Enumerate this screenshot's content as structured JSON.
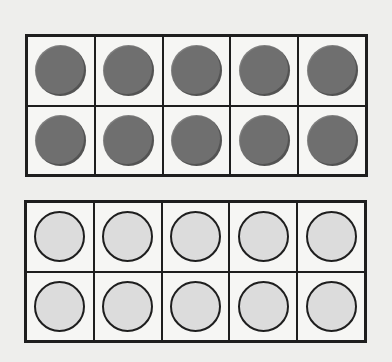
{
  "diagram": {
    "type": "ten-frames",
    "frames": [
      {
        "id": "top",
        "rows": 2,
        "columns": 5,
        "filled_count": 10,
        "cells": [
          "filled",
          "filled",
          "filled",
          "filled",
          "filled",
          "filled",
          "filled",
          "filled",
          "filled",
          "filled"
        ]
      },
      {
        "id": "bottom",
        "rows": 2,
        "columns": 5,
        "filled_count": 0,
        "cells": [
          "empty",
          "empty",
          "empty",
          "empty",
          "empty",
          "empty",
          "empty",
          "empty",
          "empty",
          "empty"
        ]
      }
    ],
    "colors": {
      "background": "#eeeeec",
      "grid_line": "#1e1e1e",
      "filled_counter": "#6f6f6f",
      "empty_counter": "#dcdcdc"
    }
  }
}
